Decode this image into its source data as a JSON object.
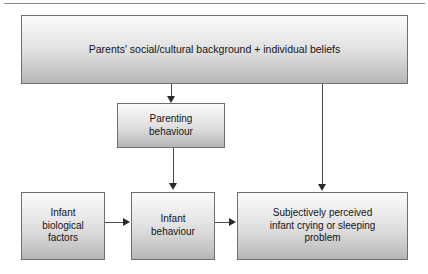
{
  "diagram": {
    "type": "flowchart",
    "title": "",
    "top_rule": true,
    "nodes": [
      {
        "id": "background",
        "label": "Parents' social/cultural background + individual beliefs",
        "shape": "rectangle",
        "fill": "#dedede",
        "border_color": "#6f6f6f"
      },
      {
        "id": "parenting",
        "label": "Parenting\nbehaviour",
        "shape": "rectangle",
        "fill": "#dedede",
        "border_color": "#6f6f6f"
      },
      {
        "id": "biological",
        "label": "Infant\nbiological\nfactors",
        "shape": "rectangle",
        "fill": "#dedede",
        "border_color": "#6f6f6f"
      },
      {
        "id": "infant_behaviour",
        "label": "Infant\nbehaviour",
        "shape": "rectangle",
        "fill": "#dedede",
        "border_color": "#6f6f6f"
      },
      {
        "id": "perceived",
        "label": "Subjectively perceived\ninfant crying or sleeping\nproblem",
        "shape": "rectangle",
        "fill": "#dedede",
        "border_color": "#6f6f6f"
      }
    ],
    "edges": [
      {
        "id": "bg-to-parenting",
        "from": "background",
        "to": "parenting",
        "direction": "down",
        "arrow": "arrow-down-icon"
      },
      {
        "id": "bg-to-perceived",
        "from": "background",
        "to": "perceived",
        "direction": "down",
        "arrow": "arrow-down-icon"
      },
      {
        "id": "parenting-to-infant",
        "from": "parenting",
        "to": "infant_behaviour",
        "direction": "down",
        "arrow": "arrow-down-icon"
      },
      {
        "id": "bio-to-infant",
        "from": "biological",
        "to": "infant_behaviour",
        "direction": "right",
        "arrow": "arrow-right-icon"
      },
      {
        "id": "infant-to-perceived",
        "from": "infant_behaviour",
        "to": "perceived",
        "direction": "right",
        "arrow": "arrow-right-icon"
      }
    ]
  }
}
